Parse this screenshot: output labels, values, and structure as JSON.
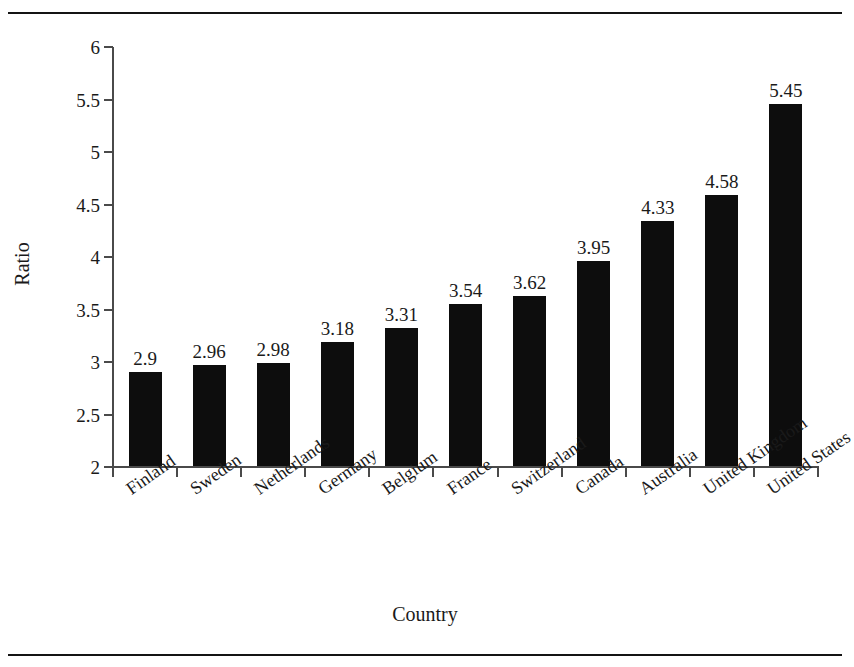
{
  "chart_data": {
    "type": "bar",
    "title": "",
    "xlabel": "Country",
    "ylabel": "Ratio",
    "categories": [
      "Finland",
      "Sweden",
      "Netherlands",
      "Germany",
      "Belgium",
      "France",
      "Switzerland",
      "Canada",
      "Australia",
      "United Kingdom",
      "United States"
    ],
    "values": [
      2.9,
      2.96,
      2.98,
      3.18,
      3.31,
      3.54,
      3.62,
      3.95,
      4.33,
      4.58,
      5.45
    ],
    "value_labels": [
      "2.9",
      "2.96",
      "2.98",
      "3.18",
      "3.31",
      "3.54",
      "3.62",
      "3.95",
      "4.33",
      "4.58",
      "5.45"
    ],
    "ylim": [
      2,
      6
    ],
    "yticks": [
      2,
      2.5,
      3,
      3.5,
      4,
      4.5,
      5,
      5.5,
      6
    ],
    "ytick_labels": [
      "2",
      "2.5",
      "3",
      "3.5",
      "4",
      "4.5",
      "5",
      "5.5",
      "6"
    ],
    "grid": false,
    "legend": null,
    "bar_color": "#0d0d0d",
    "axis_color": "#4a4a4a",
    "rule_color": "#141414",
    "background": "#ffffff"
  }
}
